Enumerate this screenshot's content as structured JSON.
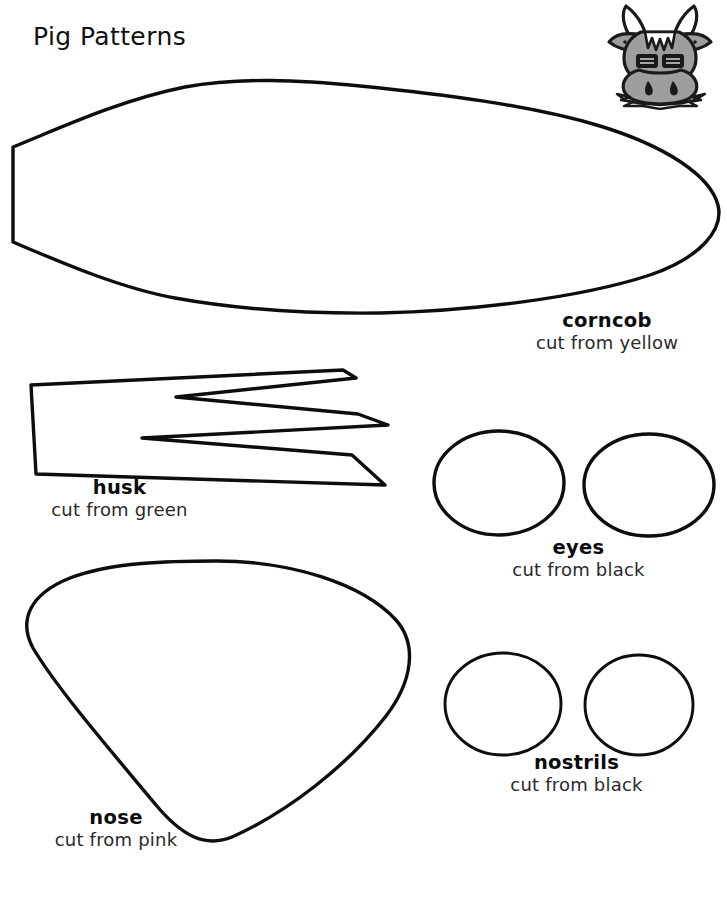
{
  "page": {
    "title": "Pig Patterns",
    "background_color": "#ffffff",
    "ink_color": "#0d0d0d",
    "width": 727,
    "height": 901
  },
  "brand": {
    "logo_icon": "cow-head-icon",
    "fill_color": "#9e9e9e",
    "outline_color": "#1a1a1a",
    "highlight_color": "#d8d8d8"
  },
  "patterns": [
    {
      "id": "corncob",
      "name": "corncob",
      "instruction": "cut from yellow",
      "shape_icon": "corncob-outline-shape",
      "color_word": "yellow"
    },
    {
      "id": "husk",
      "name": "husk",
      "instruction": "cut from green",
      "shape_icon": "husk-outline-shape",
      "color_word": "green"
    },
    {
      "id": "eyes",
      "name": "eyes",
      "instruction": "cut from black",
      "shape_icon": "eye-circle-shape",
      "color_word": "black",
      "count": 2
    },
    {
      "id": "nose",
      "name": "nose",
      "instruction": "cut from pink",
      "shape_icon": "nose-outline-shape",
      "color_word": "pink"
    },
    {
      "id": "nostrils",
      "name": "nostrils",
      "instruction": "cut from black",
      "shape_icon": "nostril-circle-shape",
      "color_word": "black",
      "count": 2
    }
  ]
}
